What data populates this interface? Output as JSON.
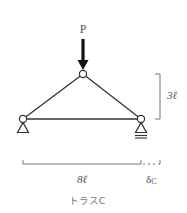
{
  "diagram": {
    "title": "トラスC",
    "load_label": "P",
    "height_label": "3ℓ",
    "span_label": "8ℓ",
    "displacement_label": "δ",
    "displacement_subscript": "C",
    "colors": {
      "line": "#333333",
      "arrow": "#111111",
      "dimension": "#666666",
      "text": "#555555"
    }
  }
}
